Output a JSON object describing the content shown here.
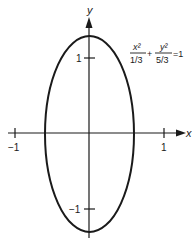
{
  "diagram": {
    "type": "ellipse-plot",
    "equation": {
      "term1_num": "x²",
      "term1_den": "1/3",
      "plus": "+",
      "term2_num": "y²",
      "term2_den": "5/3",
      "equals": "=1"
    },
    "axes": {
      "x_label": "x",
      "y_label": "y",
      "x_ticks": [
        {
          "value": -1,
          "label": "−1"
        },
        {
          "value": 1,
          "label": "1"
        }
      ],
      "y_ticks": [
        {
          "value": 1,
          "label": "1"
        },
        {
          "value": -1,
          "label": "−1"
        }
      ]
    },
    "ellipse": {
      "semi_axis_x": "1/√3",
      "semi_axis_y": "√(5/3)"
    },
    "colors": {
      "stroke": "#1a1a1a",
      "background": "#ffffff"
    }
  }
}
